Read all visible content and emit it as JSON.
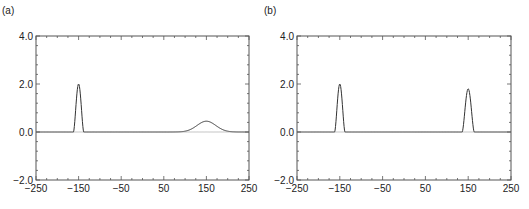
{
  "chart_data": [
    {
      "type": "line",
      "panel_label": "(a)",
      "title": "",
      "xlabel": "",
      "ylabel": "",
      "xlim": [
        -250,
        250
      ],
      "ylim": [
        -2.0,
        4.0
      ],
      "xticks": [
        -250,
        -150,
        -50,
        50,
        150,
        250
      ],
      "xtick_labels": [
        "−250",
        "−150",
        "−50",
        "50",
        "150",
        "250"
      ],
      "yticks": [
        -2.0,
        0.0,
        2.0,
        4.0
      ],
      "ytick_labels": [
        "−2.0",
        "0.0",
        "2.0",
        "4.0"
      ],
      "grid": false,
      "series": [
        {
          "name": "solution",
          "components": [
            {
              "shape": "narrow-pulse",
              "center": -150,
              "amplitude": 2.0,
              "half_width": 12
            },
            {
              "shape": "gaussian",
              "center": 150,
              "amplitude": 0.45,
              "sigma": 22
            }
          ]
        },
        {
          "name": "baseline",
          "components": [
            {
              "shape": "flat",
              "value": 0.0
            }
          ]
        }
      ]
    },
    {
      "type": "line",
      "panel_label": "(b)",
      "title": "",
      "xlabel": "",
      "ylabel": "",
      "xlim": [
        -250,
        250
      ],
      "ylim": [
        -2.0,
        4.0
      ],
      "xticks": [
        -250,
        -150,
        -50,
        50,
        150,
        250
      ],
      "xtick_labels": [
        "−250",
        "−150",
        "−50",
        "50",
        "150",
        "250"
      ],
      "yticks": [
        -2.0,
        0.0,
        2.0,
        4.0
      ],
      "ytick_labels": [
        "−2.0",
        "0.0",
        "2.0",
        "4.0"
      ],
      "grid": false,
      "series": [
        {
          "name": "solution",
          "components": [
            {
              "shape": "narrow-pulse",
              "center": -150,
              "amplitude": 2.0,
              "half_width": 12
            },
            {
              "shape": "narrow-pulse",
              "center": 150,
              "amplitude": 1.8,
              "half_width": 14
            }
          ]
        },
        {
          "name": "baseline",
          "components": [
            {
              "shape": "flat",
              "value": 0.0
            }
          ]
        }
      ]
    }
  ],
  "style": {
    "line_color": "#333333",
    "frame_color": "#555555",
    "baseline_color": "#999999"
  }
}
